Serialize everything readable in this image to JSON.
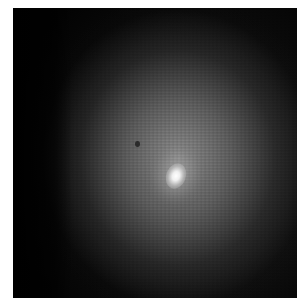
{
  "image": {
    "subject": "diffuse glowing object with bright central nucleus on dark background",
    "colors": {
      "background": "#ffffff",
      "panel": "#030303",
      "glow": "#969696",
      "nucleus": "#ffffff"
    }
  }
}
